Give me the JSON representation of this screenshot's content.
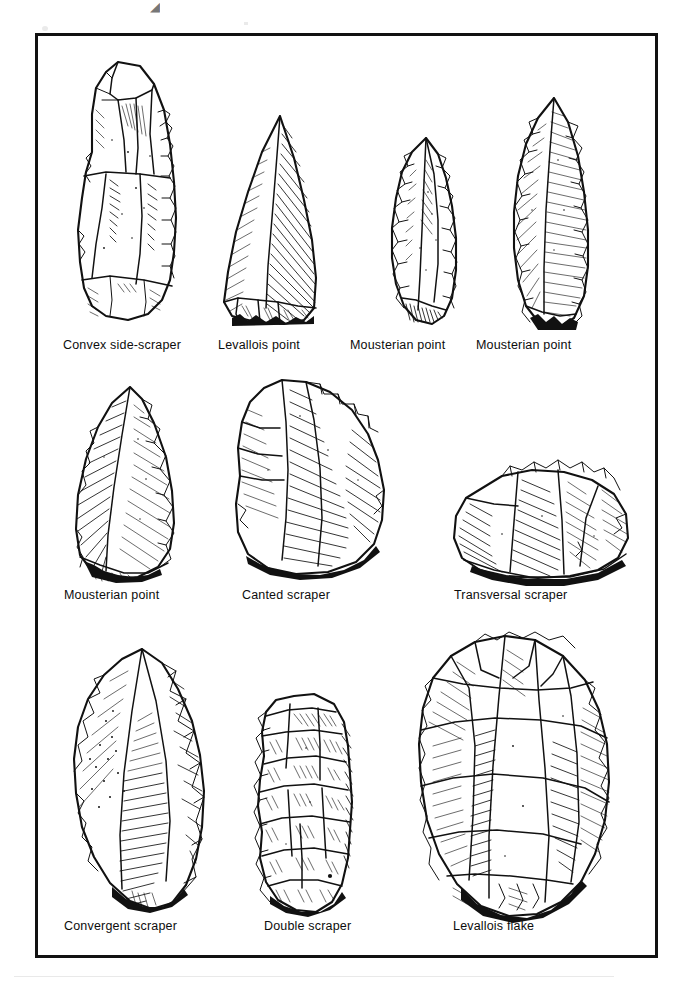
{
  "plate": {
    "title": "Mousterian stone tool types",
    "frame_color": "#111111",
    "background_color": "#ffffff",
    "ink_color": "#111111"
  },
  "rows": [
    {
      "row_index": 1,
      "items": [
        {
          "id": "convex-side-scraper",
          "caption": "Convex side-scraper",
          "shape": "elongated flake with steeply retouched convex lateral edge"
        },
        {
          "id": "levallois-point-1",
          "caption": "Levallois point",
          "shape": "triangular point, unretouched, faceted platform"
        },
        {
          "id": "mousterian-point-1",
          "caption": "Mousterian point",
          "shape": "small leaf-shaped point with bifacial marginal retouch"
        },
        {
          "id": "mousterian-point-2",
          "caption": "Mousterian point",
          "shape": "elongated leaf-shaped point with continuous retouch"
        }
      ]
    },
    {
      "row_index": 2,
      "items": [
        {
          "id": "mousterian-point-3",
          "caption": "Mousterian point",
          "shape": "broad triangular point, retouched right margin"
        },
        {
          "id": "canted-scraper",
          "caption": "Canted scraper",
          "shape": "dejete scraper, oblique working edge"
        },
        {
          "id": "transversal-scraper",
          "caption": "Transversal scraper",
          "shape": "squat flake with retouch across the distal end"
        }
      ]
    },
    {
      "row_index": 3,
      "items": [
        {
          "id": "convergent-scraper",
          "caption": "Convergent scraper",
          "shape": "two converging retouched edges meeting at a point"
        },
        {
          "id": "double-scraper",
          "caption": "Double scraper",
          "shape": "flake retouched along both lateral edges"
        },
        {
          "id": "levallois-flake",
          "caption": "Levallois flake",
          "shape": "large oval flake with radial dorsal scar pattern"
        }
      ]
    }
  ],
  "captions_flat": [
    "Convex side-scraper",
    "Levallois point",
    "Mousterian point",
    "Mousterian point",
    "Mousterian point",
    "Canted scraper",
    "Transversal scraper",
    "Convergent scraper",
    "Double scraper",
    "Levallois flake"
  ]
}
